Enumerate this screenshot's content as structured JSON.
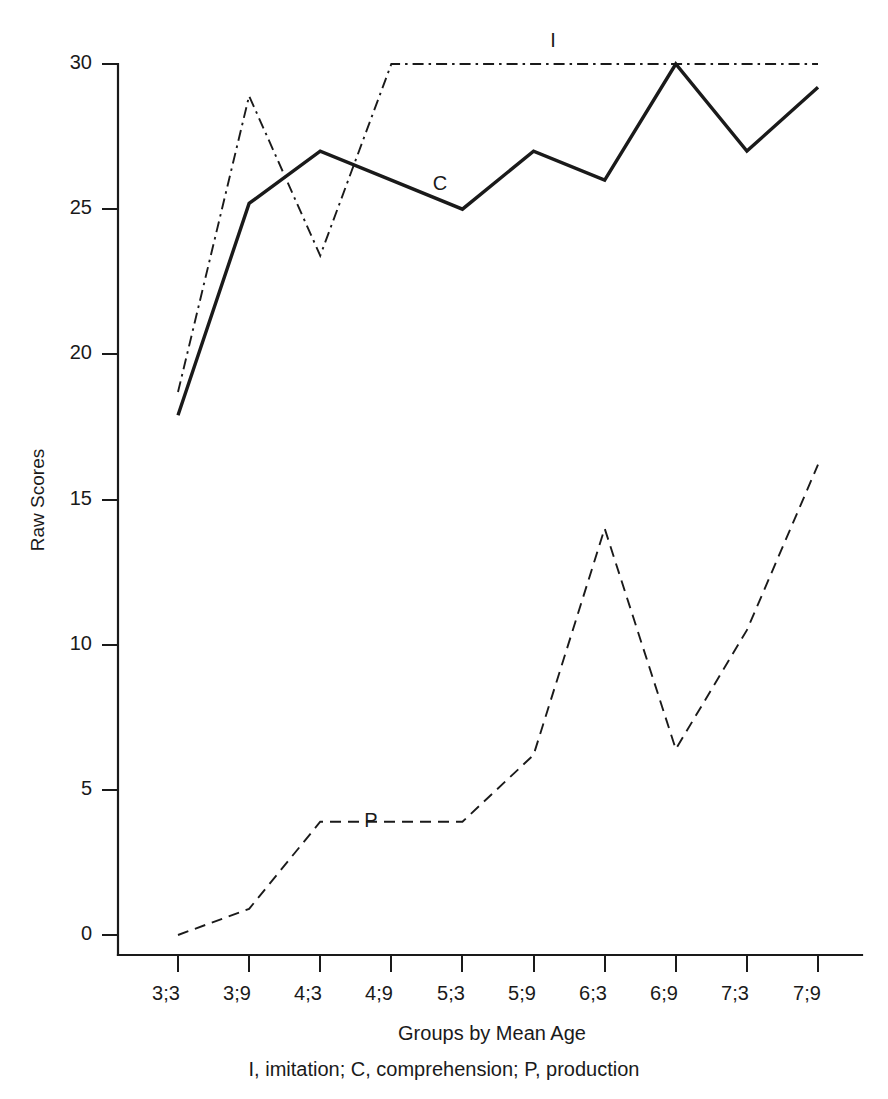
{
  "chart_data": {
    "type": "line",
    "title": "",
    "xlabel": "Groups by Mean Age",
    "ylabel": "Raw Scores",
    "categories": [
      "3;3",
      "3;9",
      "4;3",
      "4;9",
      "5;3",
      "5;9",
      "6;3",
      "6;9",
      "7;3",
      "7;9"
    ],
    "ylim": [
      0,
      30
    ],
    "xlim_categories": 10,
    "yticks": [
      0,
      5,
      10,
      15,
      20,
      25,
      30
    ],
    "ytick_labels": [
      "0",
      "5",
      "10",
      "15",
      "20",
      "25",
      "30"
    ],
    "grid": false,
    "legend": "inline-series-labels",
    "series": [
      {
        "name": "I",
        "full_name": "imitation",
        "style": "dash-dot",
        "values": [
          18.7,
          28.9,
          23.4,
          30.0,
          30.0,
          30.0,
          30.0,
          30.0,
          30.0,
          30.0
        ]
      },
      {
        "name": "C",
        "full_name": "comprehension",
        "style": "solid",
        "values": [
          17.9,
          25.2,
          27.0,
          26.0,
          25.0,
          27.0,
          26.0,
          30.0,
          27.0,
          29.2
        ]
      },
      {
        "name": "P",
        "full_name": "production",
        "style": "dashed",
        "values": [
          0.0,
          0.9,
          3.9,
          3.9,
          3.9,
          6.2,
          14.0,
          6.4,
          10.5,
          16.2
        ]
      }
    ],
    "annotations": [
      {
        "text": "I",
        "series": "I",
        "x_category": "5;9",
        "y_value": 31.5
      },
      {
        "text": "C",
        "series": "C",
        "x_category": "4;9",
        "y_value": 26.6
      },
      {
        "text": "P",
        "series": "P",
        "x_category": "4;3",
        "y_value": 4.9
      }
    ],
    "caption": "I, imitation; C, comprehension; P, production",
    "colors": {
      "axis": "#1a1a1a",
      "series": "#1a1a1a",
      "background": "#ffffff"
    }
  }
}
